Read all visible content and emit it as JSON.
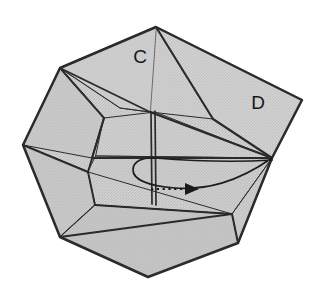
{
  "figure": {
    "kind": "origami-fold-diagram",
    "background_color": "#ffffff",
    "paper_fill": "#c9c9c9",
    "paper_fill_light": "#d2d2d2",
    "paper_fill_shade": "#bdbdbd",
    "outline_color": "#2b2b2b",
    "outline_width": 2.4,
    "crease_color": "#2b2b2b",
    "crease_width": 1.8,
    "texture": "halftone-dither"
  },
  "labels": [
    {
      "id": "label-c",
      "text": "C",
      "x": 140,
      "y": 58
    },
    {
      "id": "label-d",
      "text": "D",
      "x": 258,
      "y": 104
    }
  ],
  "outline": {
    "name": "heptagon-outline",
    "points": "156,27 302,100 272,158 238,243 148,277 60,237 23,145 60,68"
  },
  "facets": [
    {
      "id": "facet-top-left",
      "name": "top-left-facet",
      "fill": "#cecece",
      "points": "156,27 60,68 120,108 150,112"
    },
    {
      "id": "facet-c",
      "name": "facet-c",
      "fill": "#cbcbcb",
      "points": "156,27 213,119 150,112 120,108 60,68"
    },
    {
      "id": "facet-d",
      "name": "facet-d",
      "fill": "#cccccc",
      "points": "156,27 302,100 272,158 213,119"
    },
    {
      "id": "facet-left-wedge-upper",
      "name": "left-wedge-upper-facet",
      "fill": "#c6c6c6",
      "points": "60,68 23,145 92,158 104,118"
    },
    {
      "id": "facet-left-wedge-lower",
      "name": "left-wedge-lower-facet",
      "fill": "#c2c2c2",
      "points": "23,145 60,237 95,205 88,172"
    },
    {
      "id": "facet-inner-upper",
      "name": "inner-upper-facet",
      "fill": "#cacaca",
      "points": "104,118 155,112 272,158 96,156"
    },
    {
      "id": "facet-inner-lower",
      "name": "inner-lower-facet",
      "fill": "#c7c7c7",
      "points": "96,156 272,158 232,214 88,172"
    },
    {
      "id": "facet-bottom",
      "name": "bottom-facet",
      "fill": "#c4c4c4",
      "points": "60,237 148,277 238,243 272,158 232,214 95,205"
    },
    {
      "id": "facet-bottom-sliver",
      "name": "bottom-sliver-facet",
      "fill": "#bdbdbd",
      "points": "60,237 95,205 232,214 238,243 148,277"
    }
  ],
  "creases": [
    {
      "id": "crease-top-left-diag",
      "name": "crease-top-left-diagonal",
      "d": "M 60,68 L 150,112"
    },
    {
      "id": "crease-c-right",
      "name": "crease-c-right-edge",
      "d": "M 156,27 L 213,119"
    },
    {
      "id": "crease-d-lower",
      "name": "crease-d-lower-edge",
      "d": "M 213,119 L 272,158"
    },
    {
      "id": "crease-fan-upper",
      "name": "crease-fan-upper",
      "d": "M 150,112 L 272,158"
    },
    {
      "id": "crease-left-wedge-upper",
      "name": "crease-left-wedge-upper",
      "d": "M 60,68 L 104,118 L 92,158"
    },
    {
      "id": "crease-left-spine",
      "name": "crease-left-spine",
      "d": "M 104,118 L 88,172 L 95,205"
    },
    {
      "id": "crease-left-wedge-lower",
      "name": "crease-left-wedge-lower",
      "d": "M 23,145 L 88,172"
    },
    {
      "id": "crease-lower-fan",
      "name": "crease-lower-fan",
      "d": "M 95,205 L 232,214"
    },
    {
      "id": "crease-bottom-sliver",
      "name": "crease-bottom-sliver",
      "d": "M 60,237 L 232,214 L 238,243"
    },
    {
      "id": "crease-horizontal",
      "name": "crease-horizontal-center",
      "d": "M 92,158 L 272,158"
    },
    {
      "id": "crease-vertical",
      "name": "crease-vertical-center",
      "d": "M 155,111 L 156,205"
    },
    {
      "id": "crease-vertical-shadow",
      "name": "crease-vertical-center-pair",
      "d": "M 151,112 L 152,204"
    }
  ],
  "motion": {
    "curve": {
      "id": "fold-motion-curve",
      "name": "fold-motion-curve",
      "d": "M 272,158 C 236,183 206,190 175,188 C 150,186 133,180 133,170 C 133,161 143,157 155,158 C 180,160 226,163 272,160"
    },
    "arrow": {
      "id": "fold-direction-arrow",
      "name": "fold-direction-arrow",
      "shaft_d": "M 151,189 L 185,189",
      "dash_pattern": "2.2 3.6",
      "head_points": "185,183 199,189 185,195"
    }
  }
}
